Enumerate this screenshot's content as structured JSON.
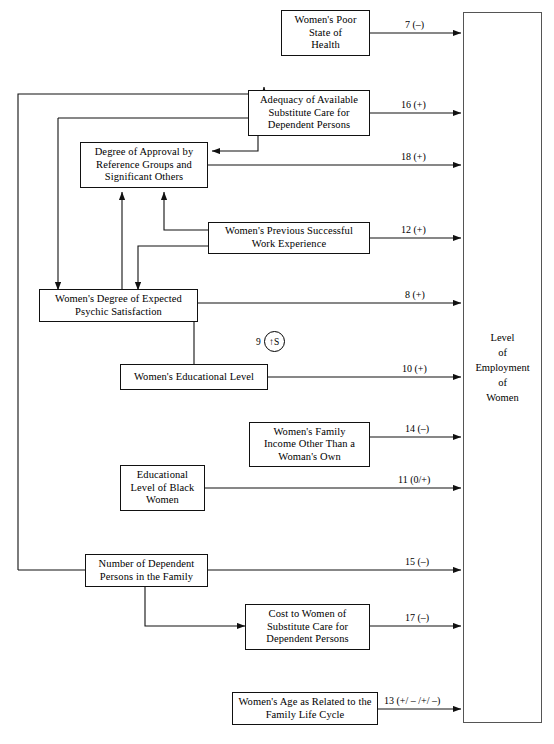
{
  "diagram": {
    "outcome": {
      "label": "Level\nof\nEmployment\nof\nWomen",
      "name": "level-of-employment-of-women"
    },
    "nodes": [
      {
        "id": "health",
        "label": "Women's Poor\nState of\nHealth"
      },
      {
        "id": "adequacy",
        "label": "Adequacy of Available\nSubstitute Care for\nDependent Persons"
      },
      {
        "id": "approval",
        "label": "Degree of Approval by\nReference Groups and\nSignificant Others"
      },
      {
        "id": "work-exp",
        "label": "Women's Previous Successful\nWork Experience"
      },
      {
        "id": "psychic",
        "label": "Women's Degree of Expected\nPsychic Satisfaction"
      },
      {
        "id": "edu-level",
        "label": "Women's Educational Level"
      },
      {
        "id": "family-income",
        "label": "Women's Family\nIncome Other Than a\nWoman's Own"
      },
      {
        "id": "edu-black",
        "label": "Educational\nLevel of Black\nWomen"
      },
      {
        "id": "dependents",
        "label": "Number of Dependent\nPersons in the Family"
      },
      {
        "id": "cost",
        "label": "Cost to Women of\nSubstitute Care for\nDependent Persons"
      },
      {
        "id": "age",
        "label": "Women's Age as Related to the\nFamily Life Cycle"
      }
    ],
    "edge_labels": [
      {
        "id": "e7",
        "text": "7 (–)"
      },
      {
        "id": "e16",
        "text": "16 (+)"
      },
      {
        "id": "e18",
        "text": "18 (+)"
      },
      {
        "id": "e12",
        "text": "12 (+)"
      },
      {
        "id": "e8",
        "text": "8 (+)"
      },
      {
        "id": "e10",
        "text": "10 (+)"
      },
      {
        "id": "e14",
        "text": "14 (–)"
      },
      {
        "id": "e11",
        "text": "11 (0/+)"
      },
      {
        "id": "e15",
        "text": "15 (–)"
      },
      {
        "id": "e17",
        "text": "17 (–)"
      },
      {
        "id": "e13",
        "text": "13 (+/ – /+/ –)"
      }
    ],
    "sigil": {
      "number": "9",
      "arrow": "↑",
      "letter": "S"
    }
  }
}
